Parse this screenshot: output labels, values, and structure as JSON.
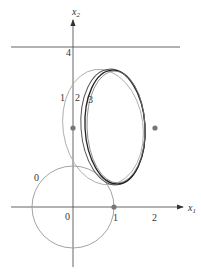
{
  "diagram": {
    "axes": {
      "x_label": "x",
      "x_sub": "1",
      "y_label": "x",
      "y_sub": "2",
      "x_ticks": [
        "0",
        "1",
        "2"
      ],
      "y_ticks": [
        "4"
      ]
    },
    "curve_labels": [
      "0",
      "1",
      "2",
      "3"
    ],
    "constraint_line_value": "4",
    "points": [
      {
        "name": "focus-left",
        "x": 0,
        "y": 2
      },
      {
        "name": "focus-right",
        "x": 2,
        "y": 2
      },
      {
        "name": "point-x1",
        "x": 1,
        "y": 0
      }
    ],
    "colors": {
      "axis": "#555555",
      "curve_light": "#999999",
      "curve_dark": "#222222",
      "dot": "#777777"
    }
  }
}
